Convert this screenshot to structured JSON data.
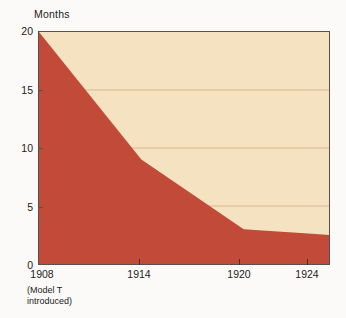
{
  "chart_data": {
    "type": "area",
    "title": "",
    "subtitle": "",
    "xlabel": "",
    "ylabel": "Months",
    "x": [
      1908,
      1914,
      1920,
      1924,
      1925
    ],
    "values": [
      20,
      9,
      3,
      2.6,
      2.5
    ],
    "series": [
      {
        "name": "Assembly time per Model T",
        "values": [
          20,
          9,
          3,
          2.6,
          2.5
        ]
      }
    ],
    "xlim": [
      1908,
      1925
    ],
    "ylim": [
      0,
      20
    ],
    "y_ticks": [
      0,
      5,
      10,
      15,
      20
    ],
    "x_ticks": [
      1908,
      1914,
      1920,
      1924
    ],
    "grid": "horizontal",
    "legend": "none",
    "annotations": [
      {
        "x": 1908,
        "text_line_1": "(Model T",
        "text_line_2": "introduced)"
      }
    ],
    "colors": {
      "area_fill": "#c14b38",
      "plot_background": "#f5e2c0",
      "gridline": "#d9b98c",
      "axis_line": "#58504a",
      "page_background": "#fbfaf8",
      "text": "#1c1c1c"
    }
  },
  "axes": {
    "y_title": "Months",
    "y_tick_labels": [
      "20",
      "15",
      "10",
      "5",
      "0"
    ],
    "x_tick_labels": [
      "1908",
      "1914",
      "1920",
      "1924"
    ],
    "x_note_line_1": "(Model T",
    "x_note_line_2": "introduced)"
  }
}
